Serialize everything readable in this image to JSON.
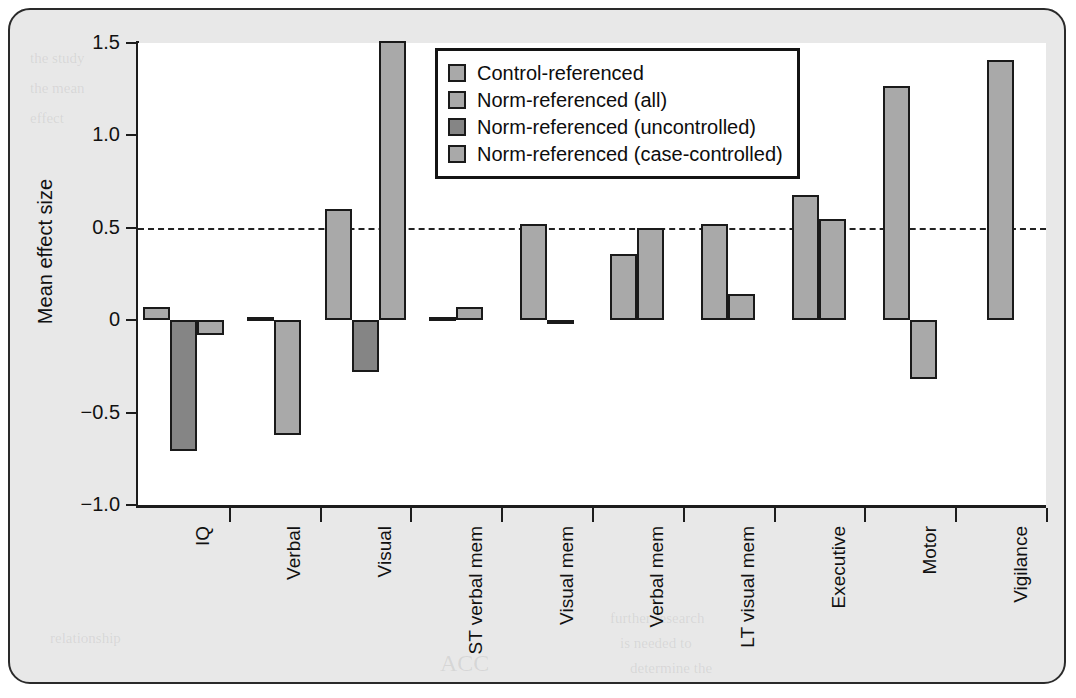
{
  "chart_data": {
    "type": "bar",
    "title": "",
    "xlabel": "",
    "ylabel": "Mean effect size",
    "ylim": [
      -1.0,
      1.5
    ],
    "yticks": [
      "1.5",
      "1.0",
      "0.5",
      "0",
      "−0.5",
      "−1.0"
    ],
    "ytick_values": [
      1.5,
      1.0,
      0.5,
      0,
      -0.5,
      -1.0
    ],
    "grid": false,
    "threshold_line": 0.5,
    "legend_position": "top-center",
    "categories": [
      "IQ",
      "Verbal",
      "Visual",
      "ST verbal mem",
      "Visual mem",
      "Verbal mem",
      "LT visual mem",
      "Executive",
      "Motor",
      "Vigilance"
    ],
    "series": [
      {
        "name": "Control-referenced",
        "color": "#a9a9a9",
        "values": [
          0.07,
          0.02,
          0.6,
          0.02,
          0.52,
          0.36,
          0.52,
          0.68,
          1.27,
          1.41
        ]
      },
      {
        "name": "Norm-referenced (all)",
        "color": "#a9a9a9",
        "values": [
          null,
          -0.62,
          null,
          0.07,
          -0.02,
          0.5,
          0.14,
          0.55,
          -0.32,
          null
        ]
      },
      {
        "name": "Norm-referenced (uncontrolled)",
        "color": "#858585",
        "values": [
          -0.71,
          null,
          -0.28,
          null,
          null,
          null,
          null,
          null,
          null,
          null
        ]
      },
      {
        "name": "Norm-referenced (case-controlled)",
        "color": "#a9a9a9",
        "values": [
          -0.08,
          null,
          1.51,
          null,
          null,
          null,
          null,
          null,
          null,
          null
        ]
      }
    ]
  },
  "legend": {
    "items": [
      {
        "label": "Control-referenced",
        "color": "#a9a9a9"
      },
      {
        "label": "Norm-referenced (all)",
        "color": "#a9a9a9"
      },
      {
        "label": "Norm-referenced (uncontrolled)",
        "color": "#858585"
      },
      {
        "label": "Norm-referenced (case-controlled)",
        "color": "#a9a9a9"
      }
    ]
  },
  "background_text": [
    "the study",
    "the mean",
    "effect",
    "across domains of",
    "neuropsychological",
    "function",
    "and",
    "controlled",
    "normative data and",
    "the number of",
    "studies was",
    "limited",
    "further research",
    "is needed to",
    "determine the",
    "relationship",
    "ACC"
  ]
}
